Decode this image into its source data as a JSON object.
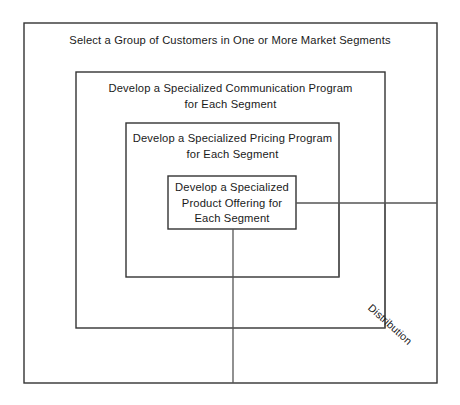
{
  "diagram": {
    "type": "nested-boxes",
    "boxes": [
      {
        "id": "outer",
        "name": "customer-group-box",
        "label": "Select a Group of Customers in One or More Market Segments",
        "x": 24,
        "y": 23,
        "width": 413,
        "height": 360
      },
      {
        "id": "communication",
        "name": "communication-program-box",
        "label": "Develop a Specialized Communication Program\nfor Each Segment",
        "x": 76,
        "y": 72,
        "width": 309,
        "height": 256
      },
      {
        "id": "pricing",
        "name": "pricing-program-box",
        "label": "Develop a Specialized Pricing Program\nfor Each Segment",
        "x": 126,
        "y": 123,
        "width": 213,
        "height": 154
      },
      {
        "id": "product",
        "name": "product-offering-box",
        "label": "Develop a Specialized\nProduct Offering for\nEach Segment",
        "x": 168,
        "y": 176,
        "width": 128,
        "height": 53
      }
    ],
    "connectors": [
      {
        "id": "product-right",
        "name": "product-offering-right-connector",
        "x1": 296,
        "y1": 203,
        "x2": 437,
        "y2": 203
      },
      {
        "id": "product-down",
        "name": "product-offering-down-connector",
        "x1": 233,
        "y1": 229,
        "x2": 233,
        "y2": 383
      },
      {
        "id": "pricing-right-vertical",
        "name": "pricing-right-vertical-connector",
        "x1": 339,
        "y1": 203,
        "x2": 339,
        "y2": 277
      },
      {
        "id": "communication-right-vertical",
        "name": "communication-right-vertical-connector",
        "x1": 385,
        "y1": 203,
        "x2": 385,
        "y2": 328
      }
    ],
    "rotated_label": {
      "name": "distribution-label",
      "text": "Distribution",
      "rotation_degrees": 42,
      "center_x": 390,
      "center_y": 325
    },
    "colors": {
      "background": "#ffffff",
      "box_stroke": "#333333",
      "connector_stroke": "#555555",
      "text": "#1a1a1a"
    }
  }
}
